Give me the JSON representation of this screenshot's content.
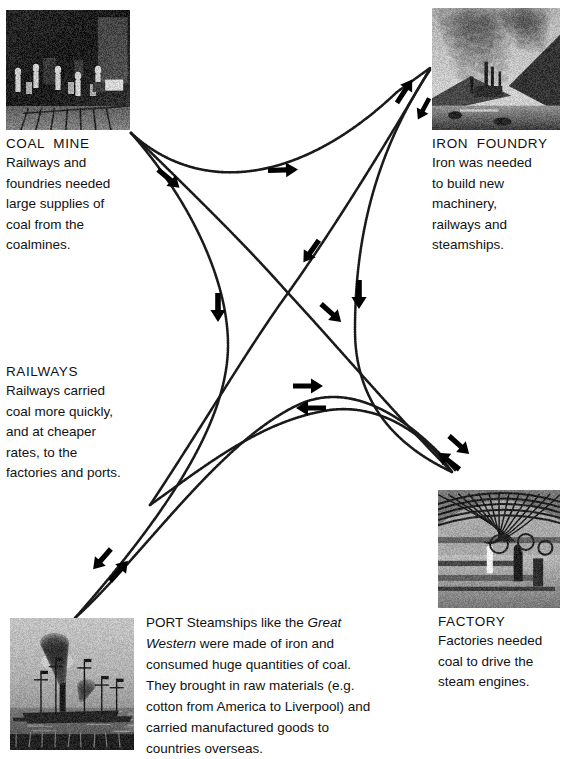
{
  "diagram": {
    "line_color": "#1a1a1a",
    "arrow_color": "#000000",
    "background": "#ffffff"
  },
  "nodes": {
    "coal_mine": {
      "label": "COAL  MINE",
      "image_name": "coal-mine-engraving",
      "description": [
        "Railways and",
        "foundries needed",
        "large supplies of",
        "coal from the",
        "coalmines."
      ]
    },
    "iron_foundry": {
      "label": "IRON  FOUNDRY",
      "image_name": "iron-foundry-engraving",
      "description": [
        "Iron was needed",
        "to build new",
        "machinery,",
        "railways and",
        "steamships."
      ]
    },
    "railways": {
      "label": "RAILWAYS",
      "description": [
        "Railways carried",
        "coal more quickly,",
        "and at cheaper",
        "rates, to the",
        "factories and ports."
      ]
    },
    "factory": {
      "label": "FACTORY",
      "image_name": "factory-interior-photo",
      "description": [
        "Factories needed",
        "coal to drive the",
        "steam engines."
      ]
    },
    "port": {
      "image_name": "port-steamship-engraving",
      "paragraph_lines": [
        "PORT Steamships like the ",
        "Western",
        " were made of iron and",
        "consumed huge quantities of coal.",
        "They brought in raw materials (e.g.",
        "cotton from America to Liverpool) and",
        "carried manufactured goods to",
        "countries overseas."
      ],
      "paragraph_italic_1": "Great",
      "paragraph_italic_2": "Western"
    }
  },
  "connections": [
    {
      "name": "coalmine-to-foundry",
      "from": "coal_mine",
      "to": "iron_foundry",
      "direction": "one-way"
    },
    {
      "name": "coalmine-to-factory",
      "from": "coal_mine",
      "to": "factory",
      "direction": "one-way"
    },
    {
      "name": "coalmine-to-port",
      "from": "coal_mine",
      "to": "port",
      "direction": "one-way"
    },
    {
      "name": "foundry-to-railways",
      "from": "iron_foundry",
      "to": "railways",
      "direction": "two-way"
    },
    {
      "name": "foundry-to-port",
      "from": "iron_foundry",
      "to": "port",
      "direction": "one-way"
    },
    {
      "name": "railways-to-factory",
      "from": "railways",
      "to": "factory",
      "direction": "two-way"
    },
    {
      "name": "railways-to-port",
      "from": "railways",
      "to": "port",
      "direction": "two-way"
    },
    {
      "name": "port-to-factory",
      "from": "port",
      "to": "factory",
      "direction": "two-way"
    }
  ]
}
